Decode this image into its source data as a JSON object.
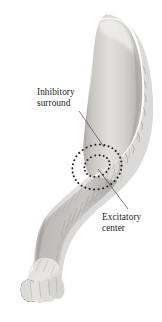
{
  "figure": {
    "background_color": "#ffffff",
    "width": 162,
    "height": 322,
    "medium": "grayscale pencil and wash anatomical illustration"
  },
  "labels": {
    "inhibitory": {
      "line1": "Inhibitory",
      "line2": "surround",
      "color": "#231f1c"
    },
    "excitatory": {
      "line1": "Excitatory",
      "line2": "center",
      "color": "#231f1c"
    }
  },
  "leader_lines": [
    {
      "name": "inhibitory-leader",
      "from": [
        79,
        111
      ],
      "to": [
        104,
        147
      ],
      "color": "#3a3633"
    },
    {
      "name": "excitatory-leader",
      "from": [
        98,
        169
      ],
      "to": [
        128,
        209
      ],
      "color": "#3a3633"
    }
  ],
  "receptive_field": {
    "outer_ring": {
      "name": "inhibitory-surround-ring",
      "center": [
        97,
        167
      ],
      "radius_x": 25,
      "radius_y": 22,
      "rotation_deg": -22,
      "dot_count": 34,
      "dot_radius": 1.05,
      "color": "#2a2724"
    },
    "inner_ring": {
      "name": "excitatory-center-ring",
      "center": [
        97,
        166
      ],
      "radius_x": 13,
      "radius_y": 10.5,
      "rotation_deg": -22,
      "dot_count": 18,
      "dot_radius": 1.0,
      "color": "#2a2724"
    }
  },
  "limb": {
    "name": "furry-hindlimb",
    "fur_base_color": "#cfcdca",
    "fur_shadow_color": "#a9a6a2",
    "fur_highlight_color": "#eeecea",
    "outline_color": "#8e8b87",
    "segments": [
      {
        "name": "upper-limb-thigh",
        "note": "vertical furry column upper right"
      },
      {
        "name": "joint-elbow",
        "note": "bend at mid-left"
      },
      {
        "name": "lower-limb-shank",
        "note": "descends down-left"
      },
      {
        "name": "paw",
        "note": "foot with toes at bottom left",
        "toe_count": 4
      }
    ]
  }
}
